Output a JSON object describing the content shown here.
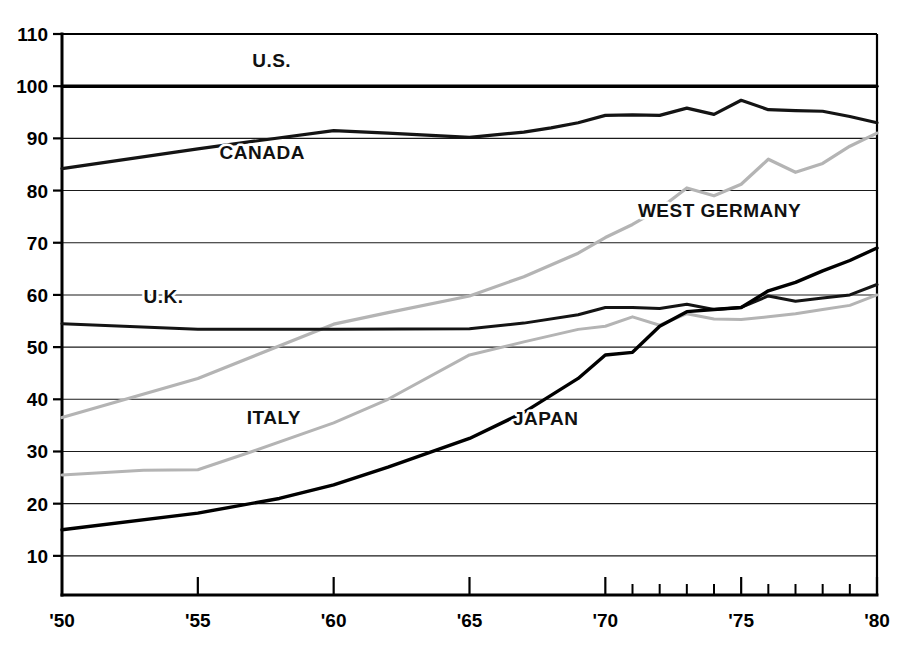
{
  "chart_data": {
    "type": "line",
    "title": "",
    "subtitle": "",
    "xlabel": "",
    "ylabel": "",
    "xlim": [
      1950,
      1980
    ],
    "ylim": [
      2.5,
      110
    ],
    "grid": true,
    "legend": "inline-labels",
    "x_tick_labels": [
      "'50",
      "'55",
      "'60",
      "'65",
      "'70",
      "'75",
      "'80"
    ],
    "x_tick_values": [
      1950,
      1955,
      1960,
      1965,
      1970,
      1975,
      1980
    ],
    "x_minor_ticks": [
      1971,
      1972,
      1973,
      1974,
      1976,
      1977,
      1978,
      1979
    ],
    "y_tick_labels": [
      "10",
      "20",
      "30",
      "40",
      "50",
      "60",
      "70",
      "80",
      "90",
      "100",
      "110"
    ],
    "y_tick_values": [
      10,
      20,
      30,
      40,
      50,
      60,
      70,
      80,
      90,
      100,
      110
    ],
    "series": [
      {
        "name": "U.S.",
        "label": "U.S.",
        "color": "#000000",
        "width": 3.4,
        "label_x": 1957.0,
        "label_y": 103.6,
        "x": [
          1950,
          1955,
          1960,
          1965,
          1970,
          1971,
          1972,
          1973,
          1974,
          1975,
          1976,
          1977,
          1978,
          1979,
          1980
        ],
        "values": [
          100,
          100,
          100,
          100,
          100,
          100,
          100,
          100,
          100,
          100,
          100,
          100,
          100,
          100,
          100
        ]
      },
      {
        "name": "Canada",
        "label": "CANADA",
        "color": "#141414",
        "width": 3.2,
        "label_x": 1955.8,
        "label_y": 86.0,
        "x": [
          1950,
          1955,
          1960,
          1962,
          1965,
          1967,
          1968,
          1969,
          1970,
          1971,
          1972,
          1973,
          1974,
          1975,
          1976,
          1977,
          1978,
          1979,
          1980
        ],
        "values": [
          84.2,
          88.0,
          91.5,
          91.0,
          90.2,
          91.2,
          92.0,
          93.0,
          94.4,
          94.5,
          94.4,
          95.8,
          94.6,
          97.3,
          95.5,
          95.3,
          95.2,
          94.2,
          93.0
        ]
      },
      {
        "name": "West Germany",
        "label": "WEST GERMANY",
        "color": "#b4b4b4",
        "width": 3.2,
        "label_x": 1971.2,
        "label_y": 75.0,
        "x": [
          1950,
          1955,
          1960,
          1962,
          1965,
          1967,
          1969,
          1970,
          1971,
          1972,
          1973,
          1974,
          1975,
          1976,
          1977,
          1978,
          1979,
          1980
        ],
        "values": [
          36.5,
          44.0,
          54.4,
          56.6,
          59.8,
          63.5,
          68.0,
          71.0,
          73.5,
          76.5,
          80.5,
          79.0,
          81.2,
          86.0,
          83.5,
          85.2,
          88.5,
          91.0
        ]
      },
      {
        "name": "U.K.",
        "label": "U.K.",
        "color": "#141414",
        "width": 3.0,
        "label_x": 1953.0,
        "label_y": 58.4,
        "x": [
          1950,
          1955,
          1960,
          1965,
          1967,
          1969,
          1970,
          1971,
          1972,
          1973,
          1974,
          1975,
          1976,
          1977,
          1978,
          1979,
          1980
        ],
        "values": [
          54.5,
          53.4,
          53.4,
          53.5,
          54.6,
          56.2,
          57.6,
          57.6,
          57.4,
          58.2,
          57.2,
          57.6,
          59.8,
          58.8,
          59.4,
          60.0,
          62.0
        ]
      },
      {
        "name": "Italy",
        "label": "ITALY",
        "color": "#b4b4b4",
        "width": 3.0,
        "label_x": 1956.8,
        "label_y": 35.2,
        "x": [
          1950,
          1953,
          1955,
          1957,
          1960,
          1962,
          1965,
          1967,
          1969,
          1970,
          1971,
          1972,
          1973,
          1974,
          1975,
          1976,
          1977,
          1978,
          1979,
          1980
        ],
        "values": [
          25.5,
          26.4,
          26.5,
          30.0,
          35.5,
          40.0,
          48.5,
          51.0,
          53.4,
          54.0,
          55.8,
          54.2,
          56.4,
          55.4,
          55.3,
          55.8,
          56.4,
          57.2,
          58.0,
          60.0
        ]
      },
      {
        "name": "Japan",
        "label": "JAPAN",
        "color": "#000000",
        "width": 3.4,
        "label_x": 1966.6,
        "label_y": 35.0,
        "x": [
          1950,
          1955,
          1958,
          1960,
          1962,
          1965,
          1967,
          1969,
          1970,
          1971,
          1972,
          1973,
          1974,
          1975,
          1976,
          1977,
          1978,
          1979,
          1980
        ],
        "values": [
          15.0,
          18.2,
          21.0,
          23.6,
          27.0,
          32.5,
          37.5,
          44.0,
          48.5,
          49.0,
          54.0,
          56.8,
          57.2,
          57.6,
          60.8,
          62.4,
          64.6,
          66.6,
          69.0
        ]
      }
    ]
  },
  "axes": {
    "x_axis_name": "year-axis",
    "y_axis_name": "index-axis"
  }
}
